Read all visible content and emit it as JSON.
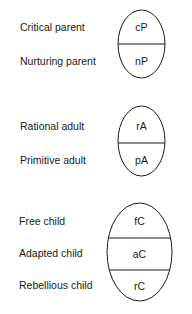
{
  "diagram": {
    "type": "ego-state-model",
    "groups": [
      {
        "name": "parent",
        "rows": [
          {
            "label": "Critical parent",
            "abbr": "cP"
          },
          {
            "label": "Nurturing parent",
            "abbr": "nP"
          }
        ]
      },
      {
        "name": "adult",
        "rows": [
          {
            "label": "Rational adult",
            "abbr": "rA"
          },
          {
            "label": "Primitive adult",
            "abbr": "pA"
          }
        ]
      },
      {
        "name": "child",
        "rows": [
          {
            "label": "Free child",
            "abbr": "fC"
          },
          {
            "label": "Adapted child",
            "abbr": "aC"
          },
          {
            "label": "Rebellious child",
            "abbr": "rC"
          }
        ]
      }
    ],
    "colors": {
      "stroke": "#1a1a1a",
      "text": "#1a1a1a",
      "background": "#ffffff"
    }
  }
}
